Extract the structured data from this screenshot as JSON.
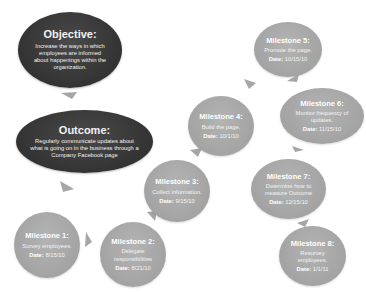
{
  "diagram": {
    "objective": {
      "title": "Objective:",
      "description": "Increase the ways in which employees are informed about happenings within the organization."
    },
    "outcome": {
      "title": "Outcome:",
      "description": "Regularly communicate updates about what is going on in the business through a Company Facebook page"
    },
    "date_label": "Date:",
    "milestones": [
      {
        "title": "Milestone 1:",
        "description": "Survey employees.",
        "date": "8/15/10"
      },
      {
        "title": "Milestone 2:",
        "description": "Delegate responsibilities",
        "date": "8/21/10"
      },
      {
        "title": "Milestone 3:",
        "description": "Collect information.",
        "date": "9/15/10"
      },
      {
        "title": "Milestone 4:",
        "description": "Build the page.",
        "date": "10/1/10"
      },
      {
        "title": "Milestone 5:",
        "description": "Promote the page.",
        "date": "10/15/10"
      },
      {
        "title": "Milestone 6:",
        "description": "Monitor frequency of updates.",
        "date": "11/15/10"
      },
      {
        "title": "Milestone 7:",
        "description": "Determine how to measure Outcome",
        "date": "12/15/10"
      },
      {
        "title": "Milestone 8:",
        "description": "Resurvey employees.",
        "date": "1/1/11"
      }
    ],
    "colors": {
      "goal_fill": "#333333",
      "milestone_fill": "#a6a6a6",
      "arrow_fill": "#a6a6a6",
      "text": "#ffffff"
    }
  }
}
